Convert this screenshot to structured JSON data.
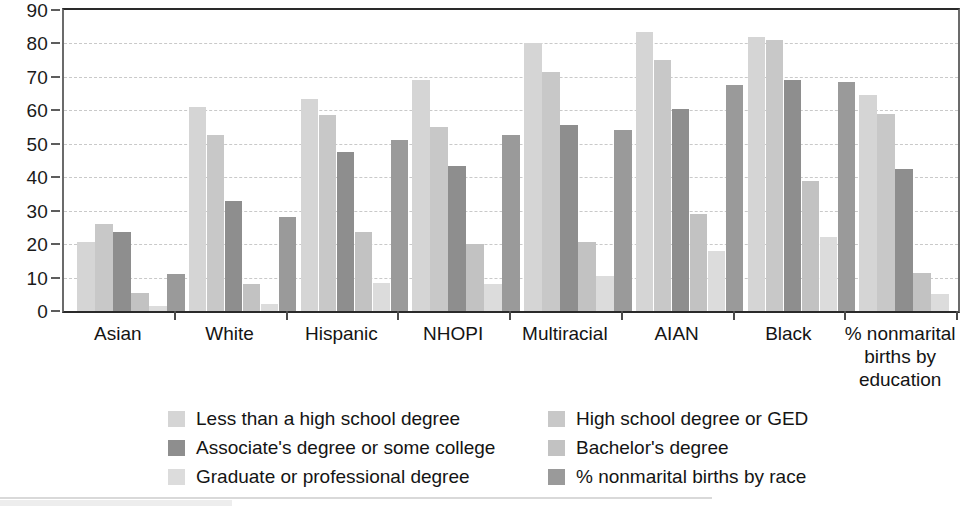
{
  "chart_data": {
    "type": "bar",
    "title": "",
    "subtitle": "",
    "xlabel": "",
    "ylabel": "",
    "ylim": [
      0,
      90
    ],
    "ytick_values": [
      0,
      10,
      20,
      30,
      40,
      50,
      60,
      70,
      80,
      90
    ],
    "ytick_labels": [
      "0",
      "10",
      "20",
      "30",
      "40",
      "50",
      "60",
      "70",
      "80",
      "90"
    ],
    "grid": true,
    "grid_axis": "y",
    "grid_style": "dashed",
    "legend_position": "bottom",
    "categories": [
      "Asian",
      "White",
      "Hispanic",
      "NHOPI",
      "Multiracial",
      "AIAN",
      "Black",
      "% nonmarital\nbirths by\neducation"
    ],
    "series": [
      {
        "name": "Less than a high school degree",
        "color": "#d5d5d5",
        "values": [
          20.5,
          61,
          63.5,
          69,
          80,
          83.5,
          82,
          64.5
        ]
      },
      {
        "name": "High school degree or GED",
        "color": "#c8c8c8",
        "values": [
          26,
          52.5,
          58.5,
          55,
          71.5,
          75,
          81,
          59
        ]
      },
      {
        "name": "Associate's degree or some college",
        "color": "#8e8e8e",
        "values": [
          23.5,
          33,
          47.5,
          43.5,
          55.5,
          60.5,
          69,
          42.5
        ]
      },
      {
        "name": "Bachelor's degree",
        "color": "#c2c2c2",
        "values": [
          5.5,
          8,
          23.5,
          20,
          20.5,
          29,
          39,
          11.5
        ]
      },
      {
        "name": "Graduate or professional degree",
        "color": "#dcdcdc",
        "values": [
          1.5,
          2,
          8.5,
          8,
          10.5,
          18,
          22,
          5
        ]
      },
      {
        "name": "% nonmarital births by race",
        "color": "#9a9a9a",
        "values": [
          11,
          28,
          51,
          52.5,
          54,
          67.5,
          68.5,
          null
        ]
      }
    ]
  },
  "legend": {
    "columns": [
      {
        "items": [
          {
            "label": "Less than a high school degree",
            "color": "#d5d5d5"
          },
          {
            "label": "Associate's degree or some college",
            "color": "#8e8e8e"
          },
          {
            "label": "Graduate or professional degree",
            "color": "#dcdcdc"
          }
        ]
      },
      {
        "items": [
          {
            "label": "High school degree or GED",
            "color": "#c8c8c8"
          },
          {
            "label": "Bachelor's degree",
            "color": "#c2c2c2"
          },
          {
            "label": "% nonmarital births by race",
            "color": "#9a9a9a"
          }
        ]
      }
    ]
  },
  "colors": {
    "axis": "#2a2a2a",
    "grid": "#c9c9c9",
    "text": "#141414",
    "background": "#ffffff"
  }
}
